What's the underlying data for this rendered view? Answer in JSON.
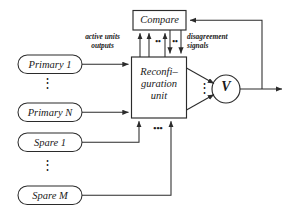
{
  "diagram": {
    "stroke_color": "#2b2b2b",
    "text_color": "#1a1a1a",
    "background": "#ffffff",
    "nodes": {
      "compare": {
        "label": "Compare",
        "shape": "rectangle"
      },
      "reconfiguration_unit": {
        "label_line1": "Reconfi–",
        "label_line2": "guration",
        "label_line3": "unit",
        "shape": "rectangle"
      },
      "voter": {
        "label": "V",
        "shape": "circle"
      },
      "primary_1": {
        "label": "Primary 1",
        "shape": "rounded-rectangle"
      },
      "primary_n": {
        "label": "Primary N",
        "shape": "rounded-rectangle"
      },
      "spare_1": {
        "label": "Spare 1",
        "shape": "rounded-rectangle"
      },
      "spare_m": {
        "label": "Spare M",
        "shape": "rounded-rectangle"
      }
    },
    "annotations": {
      "active_units_outputs": "active units\noutputs",
      "disagreement_signals": "disagreement\nsignals"
    },
    "ellipses": {
      "primary_vertical": "⋮",
      "spare_vertical": "⋮",
      "voter_vertical": "⋮",
      "bus_horizontal": "•••",
      "compare_left_pair": "••",
      "compare_right_pair": "••"
    }
  }
}
